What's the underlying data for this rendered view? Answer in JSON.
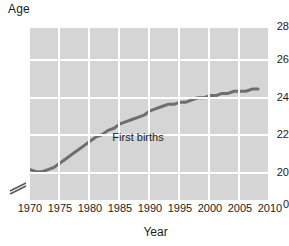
{
  "chart_data": {
    "type": "line",
    "title": "",
    "xlabel": "Year",
    "ylabel": "Age",
    "xlim": [
      1970,
      2010
    ],
    "ylim": [
      20,
      28
    ],
    "y_axis_break": true,
    "y_break_label": "0",
    "grid": true,
    "legend": "inline-annotation",
    "plot_background": "#d5d5d5",
    "gridline_color": "#ffffff",
    "line_color": "#6e6e6e",
    "xticks": [
      "1970",
      "1975",
      "1980",
      "1985",
      "1990",
      "1995",
      "2000",
      "2005",
      "2010"
    ],
    "yticks": [
      "20",
      "22",
      "24",
      "26",
      "28"
    ],
    "annotations": [
      {
        "text": "First births",
        "x": 1988,
        "y": 22.9
      }
    ],
    "series": [
      {
        "name": "First births",
        "x": [
          1970,
          1971,
          1972,
          1973,
          1974,
          1975,
          1976,
          1977,
          1978,
          1979,
          1980,
          1981,
          1982,
          1983,
          1984,
          1985,
          1986,
          1987,
          1988,
          1989,
          1990,
          1991,
          1992,
          1993,
          1994,
          1995,
          1996,
          1997,
          1998,
          1999,
          2000,
          2001,
          2002,
          2003,
          2004,
          2005,
          2006,
          2007,
          2008
        ],
        "values": [
          21.4,
          21.3,
          21.3,
          21.4,
          21.5,
          21.7,
          21.9,
          22.1,
          22.3,
          22.5,
          22.7,
          22.9,
          23.0,
          23.2,
          23.3,
          23.5,
          23.6,
          23.7,
          23.8,
          23.9,
          24.1,
          24.2,
          24.3,
          24.4,
          24.4,
          24.5,
          24.5,
          24.6,
          24.7,
          24.7,
          24.8,
          24.8,
          24.9,
          24.9,
          25.0,
          25.0,
          25.0,
          25.1,
          25.1
        ]
      }
    ]
  },
  "axis": {
    "y_title": "Age",
    "x_title": "Year"
  }
}
